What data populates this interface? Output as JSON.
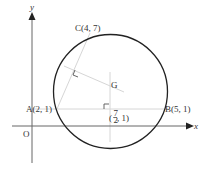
{
  "diagram": {
    "type": "geometry-circumcircle",
    "axes": {
      "x_label": "x",
      "y_label": "y",
      "origin_label": "O"
    },
    "points": {
      "A": {
        "label": "A(2, 1)",
        "x": 2,
        "y": 1
      },
      "B": {
        "label": "B(5, 1)",
        "x": 5,
        "y": 1
      },
      "C": {
        "label": "C(4, 7)",
        "x": 4,
        "y": 7
      },
      "G": {
        "label": "G"
      },
      "midpoint_AB": {
        "label_prefix": "(",
        "frac_num": "7",
        "frac_den": "2",
        "label_suffix": ", 1)"
      }
    },
    "colors": {
      "axis": "#555555",
      "circle": "#222222",
      "construction": "#cccccc",
      "text": "#333333"
    }
  }
}
